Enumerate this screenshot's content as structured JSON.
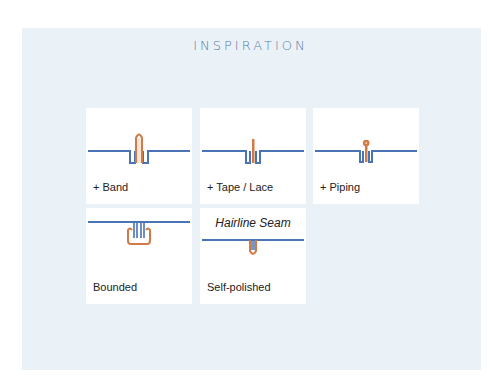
{
  "title": "INSPIRATION",
  "colors": {
    "seam_blue": "#4a74b5",
    "accent_orange": "#d07a48",
    "panel_bg": "#eaf2f8",
    "title_color": "#5b7fa8"
  },
  "cards": [
    {
      "label": "+ Band",
      "icon": "band-seam-icon"
    },
    {
      "label": "+ Tape / Lace",
      "icon": "tape-lace-seam-icon"
    },
    {
      "label": "+ Piping",
      "icon": "piping-seam-icon"
    },
    {
      "label": "Bounded",
      "icon": "bounded-seam-icon"
    },
    {
      "label": "Self-polished",
      "heading": "Hairline Seam",
      "icon": "hairline-seam-icon"
    }
  ]
}
